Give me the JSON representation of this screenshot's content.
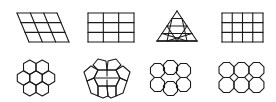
{
  "figure": {
    "stroke_color": "#1a1a1a",
    "background": "#ffffff",
    "rows": [
      {
        "name": "lattices",
        "items": [
          {
            "id": "oblique-grid",
            "kind": "parallelogram-grid",
            "cols": 3,
            "rows": 3
          },
          {
            "id": "rectangular-grid",
            "kind": "rectangle-grid",
            "cols": 3,
            "rows": 3
          },
          {
            "id": "triangular-grid",
            "kind": "triangle-grid",
            "rows": 4
          },
          {
            "id": "square-grid",
            "kind": "rectangle-grid",
            "cols": 4,
            "rows": 3
          }
        ]
      },
      {
        "name": "tilings",
        "items": [
          {
            "id": "hexagon-cluster",
            "kind": "hexagons",
            "count": 7
          },
          {
            "id": "pentagon-cluster",
            "kind": "pentagons",
            "count": 6
          },
          {
            "id": "octagon-cluster-offset",
            "kind": "octagons",
            "count": 6
          },
          {
            "id": "octagon-square-cluster",
            "kind": "octagons-squares",
            "count": 6
          }
        ]
      }
    ]
  }
}
